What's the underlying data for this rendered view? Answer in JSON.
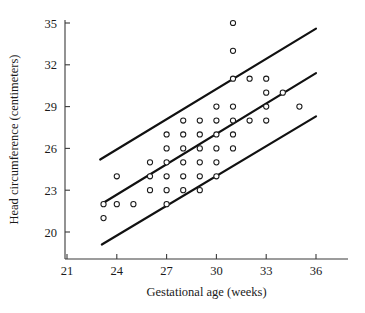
{
  "chart_data": {
    "type": "scatter",
    "title": "",
    "xlabel": "Gestational age (weeks)",
    "ylabel": "Head circumference (centimeters)",
    "xlim": [
      20.0,
      37.2
    ],
    "ylim": [
      18.6,
      35.7
    ],
    "xticks": [
      21,
      24,
      27,
      30,
      33,
      36
    ],
    "xtick_labels": [
      "21",
      "24",
      "27",
      "30",
      "33",
      "36"
    ],
    "yticks": [
      20,
      23,
      26,
      29,
      32,
      35
    ],
    "ytick_labels": [
      "20",
      "23",
      "26",
      "29",
      "32",
      "35"
    ],
    "grid": false,
    "legend": null,
    "marker": {
      "shape": "circle-open",
      "radius": 2.6,
      "stroke": "#1a1a1a",
      "fill": "#ffffff"
    },
    "points": [
      {
        "x": 23.2,
        "y": 22.0
      },
      {
        "x": 23.2,
        "y": 21.0
      },
      {
        "x": 24.0,
        "y": 24.0
      },
      {
        "x": 24.0,
        "y": 22.0
      },
      {
        "x": 25.0,
        "y": 22.0
      },
      {
        "x": 26.0,
        "y": 25.0
      },
      {
        "x": 26.0,
        "y": 24.0
      },
      {
        "x": 26.0,
        "y": 23.0
      },
      {
        "x": 27.0,
        "y": 27.0
      },
      {
        "x": 27.0,
        "y": 26.0
      },
      {
        "x": 27.0,
        "y": 25.0
      },
      {
        "x": 27.0,
        "y": 24.0
      },
      {
        "x": 27.0,
        "y": 23.0
      },
      {
        "x": 27.0,
        "y": 22.0
      },
      {
        "x": 28.0,
        "y": 28.0
      },
      {
        "x": 28.0,
        "y": 27.0
      },
      {
        "x": 28.0,
        "y": 26.0
      },
      {
        "x": 28.0,
        "y": 25.0
      },
      {
        "x": 28.0,
        "y": 24.0
      },
      {
        "x": 28.0,
        "y": 23.0
      },
      {
        "x": 29.0,
        "y": 28.0
      },
      {
        "x": 29.0,
        "y": 27.0
      },
      {
        "x": 29.0,
        "y": 26.0
      },
      {
        "x": 29.0,
        "y": 25.0
      },
      {
        "x": 29.0,
        "y": 24.0
      },
      {
        "x": 29.0,
        "y": 23.0
      },
      {
        "x": 30.0,
        "y": 29.0
      },
      {
        "x": 30.0,
        "y": 28.0
      },
      {
        "x": 30.0,
        "y": 27.0
      },
      {
        "x": 30.0,
        "y": 26.0
      },
      {
        "x": 30.0,
        "y": 25.0
      },
      {
        "x": 30.0,
        "y": 24.0
      },
      {
        "x": 31.0,
        "y": 35.0
      },
      {
        "x": 31.0,
        "y": 33.0
      },
      {
        "x": 31.0,
        "y": 31.0
      },
      {
        "x": 31.0,
        "y": 29.0
      },
      {
        "x": 31.0,
        "y": 28.0
      },
      {
        "x": 31.0,
        "y": 27.0
      },
      {
        "x": 31.0,
        "y": 26.0
      },
      {
        "x": 32.0,
        "y": 31.0
      },
      {
        "x": 32.0,
        "y": 28.0
      },
      {
        "x": 33.0,
        "y": 31.0
      },
      {
        "x": 33.0,
        "y": 30.0
      },
      {
        "x": 33.0,
        "y": 29.0
      },
      {
        "x": 33.0,
        "y": 28.0
      },
      {
        "x": 34.0,
        "y": 30.0
      },
      {
        "x": 35.0,
        "y": 29.0
      }
    ],
    "reference_lines": [
      {
        "name": "upper-reference-line",
        "x1": 23.0,
        "y1": 25.2,
        "x2": 36.0,
        "y2": 34.6
      },
      {
        "name": "middle-reference-line",
        "x1": 23.2,
        "y1": 22.1,
        "x2": 36.0,
        "y2": 31.4
      },
      {
        "name": "lower-reference-line",
        "x1": 23.1,
        "y1": 19.1,
        "x2": 36.0,
        "y2": 28.3
      }
    ],
    "reference_line_style": {
      "stroke": "#111111",
      "width": 2.2
    }
  }
}
